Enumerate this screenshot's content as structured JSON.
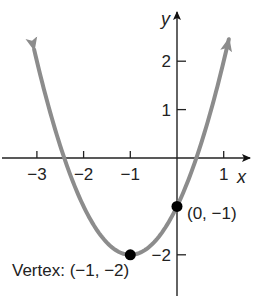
{
  "chart_data": {
    "type": "line",
    "function": "y = x^2 + 2x - 1",
    "title": "",
    "xlabel": "x",
    "ylabel": "y",
    "xlim": [
      -3.75,
      1.75
    ],
    "ylim": [
      -2.85,
      3.2
    ],
    "x_ticks": [
      -3,
      -2,
      -1,
      1
    ],
    "x_tick_labels": [
      "−3",
      "−2",
      "−1",
      "1"
    ],
    "y_ticks": [
      2,
      1,
      -2
    ],
    "y_tick_labels": [
      "2",
      "1",
      "−2"
    ],
    "grid": false,
    "curve_range": [
      -3.06,
      1.11
    ],
    "curve_color": "#8c8c8c",
    "points": [
      {
        "x": -1,
        "y": -2,
        "label": "Vertex: (−1, −2)"
      },
      {
        "x": 0,
        "y": -1,
        "label": "(0, −1)"
      }
    ]
  }
}
